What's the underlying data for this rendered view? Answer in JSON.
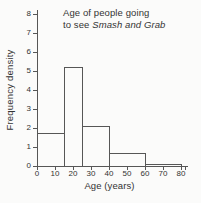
{
  "chart": {
    "title_line1": "Age of people going",
    "title_line2_prefix": "to see ",
    "title_line2_italic": "Smash and Grab",
    "ylabel": "Frequency density",
    "xlabel": "Age (years)",
    "colors": {
      "line": "#565656",
      "text": "#333333",
      "background": "#fbfbfa"
    }
  },
  "chart_data": {
    "type": "bar",
    "subtype": "histogram",
    "title": "Age of people going to see Smash and Grab",
    "xlabel": "Age (years)",
    "ylabel": "Frequency density",
    "xlim": [
      0,
      80
    ],
    "ylim": [
      0,
      8
    ],
    "x_ticks": [
      0,
      10,
      20,
      30,
      40,
      50,
      60,
      70,
      80
    ],
    "y_ticks": [
      0,
      1,
      2,
      3,
      4,
      5,
      6,
      7,
      8
    ],
    "grid": false,
    "legend": false,
    "bins": [
      {
        "from": 0,
        "to": 15,
        "frequency_density": 1.75
      },
      {
        "from": 15,
        "to": 25,
        "frequency_density": 5.2
      },
      {
        "from": 25,
        "to": 40,
        "frequency_density": 2.1
      },
      {
        "from": 40,
        "to": 60,
        "frequency_density": 0.7
      },
      {
        "from": 60,
        "to": 80,
        "frequency_density": 0.1
      }
    ]
  }
}
